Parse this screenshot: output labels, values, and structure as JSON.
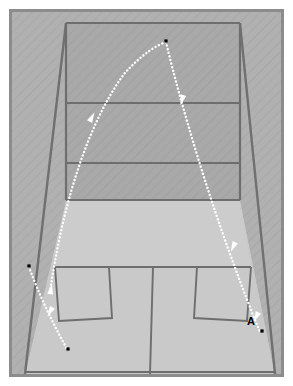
{
  "figure": {
    "domain_kind": "diagram",
    "title": "",
    "labels": [
      {
        "text": "A",
        "x": 243,
        "y": 316,
        "name": "point-label-a"
      }
    ],
    "colors": {
      "page_background": "#ffffff",
      "frame_border": "#8c8c8c",
      "side_wall": "#b0b0b0",
      "front_wall": "#a9a9a9",
      "floor": "#c9c9c9",
      "court_line": "#6e6e6e",
      "corner_edge": "#707070",
      "trajectory": "#ffffff",
      "marker_dot": "#000000"
    },
    "geometry": {
      "frame": {
        "x": 9,
        "y": 9,
        "w": 275,
        "h": 368,
        "stroke_width": 3
      },
      "front_wall": {
        "top_y": 20,
        "left_x": 63,
        "right_x": 237,
        "bottom_y": 197
      },
      "back_floor_bottom_y": 371,
      "floor_bottom_left_x": 22,
      "floor_bottom_right_x": 272,
      "out_line_y": 100,
      "service_line_y": 160,
      "short_line_y": 264
    },
    "court": {
      "type": "squash-court-rear-perspective",
      "front_wall_lines": [
        {
          "name": "out-line",
          "y": 100
        },
        {
          "name": "service-line",
          "y": 160
        },
        {
          "name": "tin-line",
          "y": 197
        }
      ],
      "floor_lines": [
        {
          "name": "short-line"
        },
        {
          "name": "half-court-line"
        },
        {
          "name": "service-box-left"
        },
        {
          "name": "service-box-right"
        }
      ]
    },
    "trajectory": {
      "name": "ball-path",
      "style": "dotted",
      "dot_radius": 1.15,
      "dot_spacing": 4.0,
      "segments": [
        {
          "name": "serve-arc-rising",
          "points": [
            [
              47,
              287
            ],
            [
              58,
              230
            ],
            [
              72,
              170
            ],
            [
              92,
              115
            ],
            [
              122,
              68
            ],
            [
              150,
              45
            ],
            [
              163,
              39
            ]
          ]
        },
        {
          "name": "descent-to-floor-right",
          "points": [
            [
              163,
              39
            ],
            [
              172,
              72
            ],
            [
              182,
              108
            ],
            [
              195,
              152
            ],
            [
              210,
              196
            ],
            [
              228,
              244
            ],
            [
              241,
              278
            ],
            [
              250,
              302
            ],
            [
              256,
              322
            ]
          ]
        },
        {
          "name": "rebound-left-low",
          "points": [
            [
              28,
              264
            ],
            [
              36,
              288
            ],
            [
              44,
              306
            ],
            [
              53,
              326
            ],
            [
              62,
              342
            ]
          ]
        }
      ],
      "arrowheads": [
        {
          "x": 88,
          "y": 113,
          "angle": -62,
          "name": "arrowhead-rising"
        },
        {
          "x": 46,
          "y": 290,
          "angle": -104,
          "name": "arrowhead-left-wall"
        },
        {
          "x": 178,
          "y": 96,
          "angle": 72,
          "name": "arrowhead-descent-upper"
        },
        {
          "x": 230,
          "y": 244,
          "angle": 70,
          "name": "arrowhead-descent-mid"
        },
        {
          "x": 253,
          "y": 313,
          "angle": 68,
          "name": "arrowhead-descent-lower"
        },
        {
          "x": 46,
          "y": 309,
          "angle": 64,
          "name": "arrowhead-rebound"
        }
      ],
      "endpoint_dots": [
        {
          "x": 163,
          "y": 38,
          "name": "apex-dot"
        },
        {
          "x": 257,
          "y": 328,
          "name": "impact-dot-right"
        },
        {
          "x": 24,
          "y": 263,
          "name": "origin-dot-left-wall"
        },
        {
          "x": 63,
          "y": 345,
          "name": "end-dot-left-floor"
        }
      ]
    }
  }
}
